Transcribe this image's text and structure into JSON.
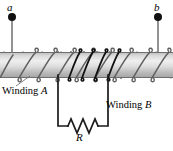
{
  "figure": {
    "type": "physics-circuit-diagram",
    "width": 173,
    "height": 151
  },
  "terminals": {
    "left": {
      "label": "a",
      "dot_x": 12,
      "dot_y": 17
    },
    "right": {
      "label": "b",
      "dot_x": 158,
      "dot_y": 17
    }
  },
  "labels": {
    "winding_a": {
      "text_main": "Winding ",
      "text_italic": "A"
    },
    "winding_b": {
      "text_main": "Winding ",
      "text_italic": "B"
    },
    "resistor": "R"
  },
  "colors": {
    "winding_a_stroke": "#666666",
    "winding_b_stroke": "#111111",
    "rod_light": "#e8e8e8",
    "rod_mid": "#cfcfcf",
    "rod_dark": "#a9a9a9",
    "rod_outline": "#6e6e6e",
    "wire": "#555555",
    "circuit_stroke": "#1a1a1a",
    "text": "#000000"
  },
  "geometry": {
    "rod": {
      "x": 0,
      "y": 52,
      "width": 173,
      "height": 26
    },
    "winding_a": {
      "turns": 9,
      "start_x": 4,
      "pitch": 19
    },
    "winding_b": {
      "turns": 5,
      "start_x": 58,
      "pitch": 13
    },
    "circuit": {
      "left_lead_x": 58,
      "right_lead_x": 108,
      "bottom_y": 126
    }
  }
}
